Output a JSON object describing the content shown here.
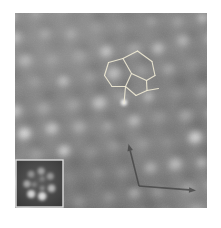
{
  "figure": {
    "width": 221,
    "height": 228,
    "background_color": "#ffffff"
  },
  "micrograph": {
    "x": 15,
    "y": 13,
    "width": 192,
    "height": 195,
    "base_color": "#878787",
    "grain_opacity": 0.1,
    "lattice": {
      "u": [
        26.5,
        -3.0
      ],
      "v": [
        9.0,
        23.0
      ],
      "origin": [
        -60,
        8
      ],
      "cols": 12,
      "rows": 10,
      "seed": 1337,
      "jitter": 5,
      "spot_color": "#ffffff",
      "spot_radius_min": 4.6,
      "spot_radius_max": 7.0,
      "spot_opacity_min": 0.2,
      "spot_opacity_max": 0.58,
      "bright_fraction": 0.22,
      "bright_opacity": 0.85,
      "dark_color": "#000000",
      "dark_opacity": 0.14,
      "dark_radius": 6.5
    },
    "shading": [
      {
        "x": 45,
        "y": 35,
        "rx": 70,
        "ry": 45,
        "color": "#ffffff",
        "opacity": 0.06
      },
      {
        "x": 95,
        "y": 195,
        "rx": 80,
        "ry": 45,
        "color": "#000000",
        "opacity": 0.09
      },
      {
        "x": 202,
        "y": 120,
        "rx": 50,
        "ry": 60,
        "color": "#000000",
        "opacity": 0.05
      }
    ]
  },
  "molecule_overlay": {
    "stroke_color": "#ece7d2",
    "stroke_width": 1.1,
    "nodes": {
      "A": [
        108.5,
        62.5
      ],
      "B": [
        104.5,
        75.5
      ],
      "C": [
        112.0,
        86.5
      ],
      "D": [
        125.5,
        86.5
      ],
      "E": [
        131.5,
        73.5
      ],
      "F": [
        123.0,
        58.5
      ],
      "G": [
        137.5,
        51.0
      ],
      "H": [
        152.0,
        61.5
      ],
      "I": [
        155.0,
        75.5
      ],
      "J": [
        146.5,
        80.5
      ],
      "K": [
        147.0,
        90.5
      ],
      "L": [
        136.0,
        95.5
      ],
      "M": [
        124.0,
        103.5
      ],
      "N": [
        158.5,
        88.5
      ]
    },
    "edges": [
      [
        "A",
        "B"
      ],
      [
        "B",
        "C"
      ],
      [
        "C",
        "D"
      ],
      [
        "D",
        "E"
      ],
      [
        "E",
        "F"
      ],
      [
        "F",
        "A"
      ],
      [
        "F",
        "G"
      ],
      [
        "G",
        "H"
      ],
      [
        "H",
        "I"
      ],
      [
        "I",
        "J"
      ],
      [
        "J",
        "E"
      ],
      [
        "J",
        "K"
      ],
      [
        "K",
        "L"
      ],
      [
        "L",
        "D"
      ],
      [
        "D",
        "M"
      ],
      [
        "K",
        "N"
      ]
    ],
    "glow": {
      "x": 124,
      "y": 102.5,
      "r": 3.2,
      "color": "#ffffff",
      "opacity": 0.85
    }
  },
  "lattice_vectors": {
    "color": "#454545",
    "opacity": 0.8,
    "stroke_width": 1.6,
    "head_length": 7,
    "head_width": 5.5,
    "origin": [
      139,
      186
    ],
    "tips": [
      [
        128.5,
        144
      ],
      [
        196,
        190.5
      ]
    ]
  },
  "inset": {
    "x": 16,
    "y": 160,
    "size": 47,
    "border_color": "#dcdcdc",
    "border_width": 1.4,
    "bg_center_color": "#5c5c5c",
    "bg_edge_color": "#3a3a3a",
    "center": [
      39.5,
      183.5
    ],
    "lobe_color": "#e2e2e2",
    "lobes": [
      {
        "angle": 78,
        "radius": 13.0,
        "size": 4.2,
        "opacity": 0.95
      },
      {
        "angle": 128,
        "radius": 13.5,
        "size": 4.0,
        "opacity": 0.9
      },
      {
        "angle": 178,
        "radius": 12.5,
        "size": 3.6,
        "opacity": 0.6
      },
      {
        "angle": 228,
        "radius": 12.5,
        "size": 3.4,
        "opacity": 0.45
      },
      {
        "angle": 278,
        "radius": 12.5,
        "size": 3.6,
        "opacity": 0.55
      },
      {
        "angle": 326,
        "radius": 13.0,
        "size": 3.5,
        "opacity": 0.5
      },
      {
        "angle": 22,
        "radius": 13.0,
        "size": 3.8,
        "opacity": 0.7
      }
    ],
    "inner_lobes": [
      {
        "angle": 60,
        "radius": 5.5,
        "size": 2.6,
        "opacity": 0.38
      },
      {
        "angle": 170,
        "radius": 5.5,
        "size": 2.6,
        "opacity": 0.34
      },
      {
        "angle": 300,
        "radius": 5.5,
        "size": 2.6,
        "opacity": 0.3
      }
    ]
  }
}
